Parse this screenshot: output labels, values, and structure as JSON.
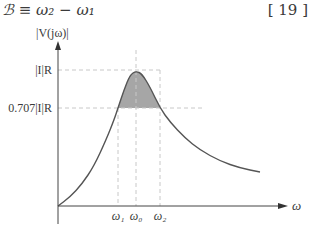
{
  "equation": {
    "text": "ℬ ≡ ω₂ − ω₁",
    "number": "[ 19 ]"
  },
  "chart_data": {
    "type": "line",
    "title": "",
    "ylabel": "|V(jω)|",
    "xlabel": "ω",
    "y_ticks": [
      {
        "label": "|I|R",
        "value": 1.0
      },
      {
        "label": "0.707|I|R",
        "value": 0.707
      }
    ],
    "x_ticks": [
      {
        "label": "ω₁",
        "value": 0.87
      },
      {
        "label": "ω₀",
        "value": 1.0
      },
      {
        "label": "ω₂",
        "value": 1.17
      }
    ],
    "series": [
      {
        "name": "|V(jω)|",
        "description": "resonance curve, shaded above 0.707 between ω₁ and ω₂",
        "x": [
          0,
          0.2,
          0.4,
          0.6,
          0.75,
          0.87,
          0.95,
          1.0,
          1.05,
          1.17,
          1.3,
          1.5,
          1.75,
          2.0,
          2.25,
          2.5
        ],
        "y": [
          0,
          0.08,
          0.2,
          0.38,
          0.58,
          0.707,
          0.9,
          1.0,
          0.95,
          0.707,
          0.57,
          0.45,
          0.36,
          0.3,
          0.26,
          0.23
        ]
      }
    ],
    "shaded_region": {
      "from": "ω₁",
      "to": "ω₂",
      "above": 0.707,
      "color": "#a8a8a8"
    },
    "grid": false,
    "xlim": [
      0,
      2.6
    ],
    "ylim": [
      0,
      1.25
    ]
  }
}
